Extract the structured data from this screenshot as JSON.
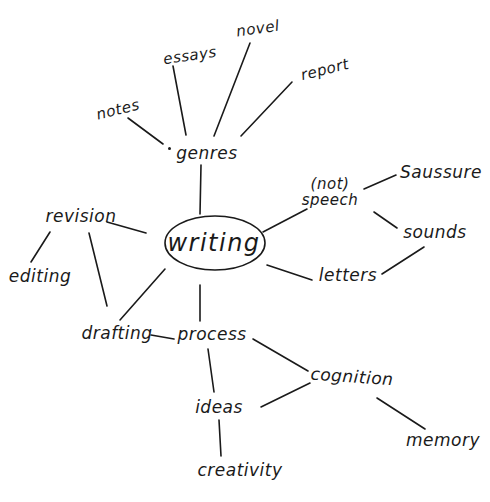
{
  "diagram": {
    "type": "mind-map",
    "style": "hand-drawn",
    "center": {
      "id": "writing",
      "label": "writing"
    },
    "nodes": {
      "writing": "writing",
      "genres": "genres",
      "notes": "notes",
      "essays": "essays",
      "novel": "novel",
      "report": "report",
      "speech_prefix": "(not)",
      "speech": "speech",
      "saussure": "Saussure",
      "sounds": "sounds",
      "letters": "letters",
      "revision": "revision",
      "editing": "editing",
      "drafting": "drafting",
      "process": "process",
      "ideas": "ideas",
      "creativity": "creativity",
      "cognition": "cognition",
      "memory": "memory"
    },
    "edges": [
      [
        "writing",
        "genres"
      ],
      [
        "genres",
        "notes"
      ],
      [
        "genres",
        "essays"
      ],
      [
        "genres",
        "novel"
      ],
      [
        "genres",
        "report"
      ],
      [
        "writing",
        "speech"
      ],
      [
        "speech",
        "saussure"
      ],
      [
        "speech",
        "sounds"
      ],
      [
        "sounds",
        "letters"
      ],
      [
        "writing",
        "letters"
      ],
      [
        "writing",
        "revision"
      ],
      [
        "revision",
        "editing"
      ],
      [
        "revision",
        "drafting"
      ],
      [
        "writing",
        "drafting"
      ],
      [
        "writing",
        "process"
      ],
      [
        "drafting",
        "process"
      ],
      [
        "process",
        "ideas"
      ],
      [
        "process",
        "cognition"
      ],
      [
        "ideas",
        "cognition"
      ],
      [
        "ideas",
        "creativity"
      ],
      [
        "cognition",
        "memory"
      ]
    ]
  }
}
